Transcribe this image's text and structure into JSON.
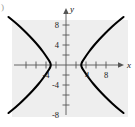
{
  "figure": {
    "corner_mark": ")",
    "background_color": "#eeeeee",
    "page_color": "#ffffff",
    "curve_color": "#000000",
    "axis_color": "#555555",
    "text_color": "#222222"
  },
  "chart_data": {
    "type": "line",
    "title": "",
    "subtitle": "",
    "xlabel": "x",
    "ylabel": "y",
    "xlim": [
      -10,
      12
    ],
    "ylim": [
      -11,
      11
    ],
    "grid": false,
    "legend": null,
    "axes": {
      "x_axis_label": "x",
      "y_axis_label": "y",
      "x_tick_values": [
        -8,
        -6,
        -4,
        -2,
        2,
        4,
        6,
        8
      ],
      "x_tick_labels": [
        "",
        "",
        "-4",
        "",
        "",
        "4",
        "",
        "8"
      ],
      "y_tick_values": [
        -8,
        -6,
        -4,
        -2,
        2,
        4,
        6,
        8
      ],
      "y_tick_labels": [
        "-8",
        "",
        "-4",
        "",
        "",
        "4",
        "",
        "8"
      ],
      "labeled_x_ticks": [
        {
          "value": -4,
          "label": "-4"
        },
        {
          "value": 4,
          "label": "4"
        },
        {
          "value": 8,
          "label": "8"
        }
      ],
      "labeled_y_ticks": [
        {
          "value": 8,
          "label": "8"
        },
        {
          "value": 4,
          "label": "4"
        },
        {
          "value": -4,
          "label": "-4"
        },
        {
          "value": -8,
          "label": "-8"
        }
      ],
      "tick_interval": 2,
      "x_arrow": true,
      "y_arrow": true
    },
    "curve_description": "hyperbola opening left and right",
    "series": [
      {
        "name": "right-branch",
        "points": [
          [
            11.5,
            9.6
          ],
          [
            10.0,
            8.4
          ],
          [
            8.5,
            7.0
          ],
          [
            7.2,
            5.7
          ],
          [
            6.0,
            4.4
          ],
          [
            5.0,
            3.2
          ],
          [
            4.2,
            2.1
          ],
          [
            3.6,
            1.2
          ],
          [
            3.2,
            0.6
          ],
          [
            3.0,
            0.0
          ],
          [
            3.2,
            -0.6
          ],
          [
            3.6,
            -1.2
          ],
          [
            4.2,
            -2.1
          ],
          [
            5.0,
            -3.2
          ],
          [
            6.0,
            -4.4
          ],
          [
            7.2,
            -5.7
          ],
          [
            8.5,
            -7.0
          ],
          [
            10.0,
            -8.4
          ],
          [
            11.5,
            -9.6
          ]
        ]
      },
      {
        "name": "left-branch",
        "points": [
          [
            -11.5,
            9.6
          ],
          [
            -10.0,
            8.4
          ],
          [
            -8.5,
            7.0
          ],
          [
            -7.2,
            5.7
          ],
          [
            -6.0,
            4.4
          ],
          [
            -5.0,
            3.2
          ],
          [
            -4.2,
            2.1
          ],
          [
            -3.6,
            1.2
          ],
          [
            -3.2,
            0.6
          ],
          [
            -3.0,
            0.0
          ],
          [
            -3.2,
            -0.6
          ],
          [
            -3.6,
            -1.2
          ],
          [
            -4.2,
            -2.1
          ],
          [
            -5.0,
            -3.2
          ],
          [
            -6.0,
            -4.4
          ],
          [
            -7.2,
            -5.7
          ],
          [
            -8.5,
            -7.0
          ],
          [
            -10.0,
            -8.4
          ],
          [
            -11.5,
            -9.6
          ]
        ]
      }
    ]
  }
}
